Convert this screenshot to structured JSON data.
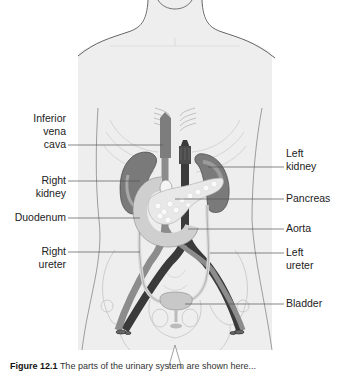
{
  "figure": {
    "labels_left": [
      {
        "id": "inferior-vena-cava",
        "lines": [
          "Inferior",
          "vena",
          "cava"
        ]
      },
      {
        "id": "right-kidney",
        "lines": [
          "Right",
          "kidney"
        ]
      },
      {
        "id": "duodenum",
        "lines": [
          "Duodenum"
        ]
      },
      {
        "id": "right-ureter",
        "lines": [
          "Right",
          "ureter"
        ]
      }
    ],
    "labels_right": [
      {
        "id": "left-kidney",
        "lines": [
          "Left",
          "kidney"
        ]
      },
      {
        "id": "pancreas",
        "lines": [
          "Pancreas"
        ]
      },
      {
        "id": "aorta",
        "lines": [
          "Aorta"
        ]
      },
      {
        "id": "left-ureter",
        "lines": [
          "Left",
          "ureter"
        ]
      },
      {
        "id": "bladder",
        "lines": [
          "Bladder"
        ]
      }
    ],
    "caption": {
      "number": "Figure 12.1",
      "text": "The parts of the urinary system are shown here..."
    },
    "colors": {
      "body_fill": "#efefef",
      "body_stroke": "#555555",
      "kidney": "#7a7a7a",
      "aorta": "#3a3a3a",
      "vena_cava": "#8c8c8c",
      "pancreas": "#e6e6e6",
      "duodenum": "#cfcfcf",
      "bladder": "#c8c8c8",
      "ureter": "#d8d8d8",
      "leader_line": "#555555"
    }
  }
}
